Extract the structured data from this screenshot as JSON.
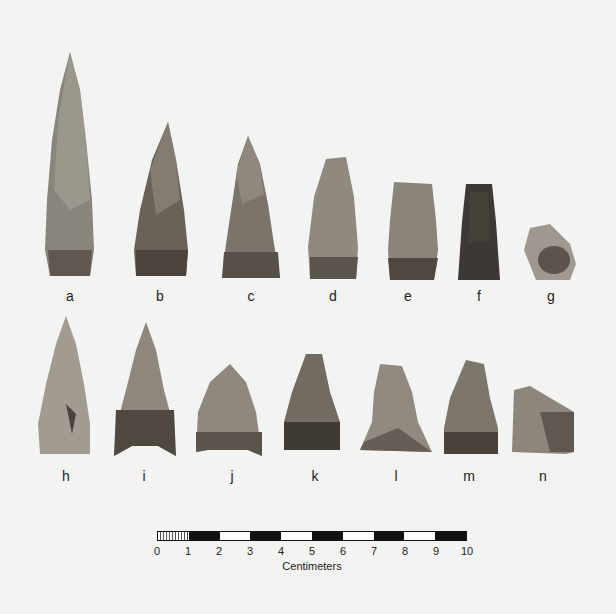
{
  "figure": {
    "background": "#f3f3f1",
    "artifact_labels": [
      "a",
      "b",
      "c",
      "d",
      "e",
      "f",
      "g",
      "h",
      "i",
      "j",
      "k",
      "l",
      "m",
      "n"
    ]
  },
  "scale": {
    "unit_label": "Centimeters",
    "ticks": [
      "0",
      "1",
      "2",
      "3",
      "4",
      "5",
      "6",
      "7",
      "8",
      "9",
      "10"
    ]
  }
}
